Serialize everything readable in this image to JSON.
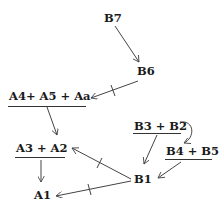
{
  "diagram": {
    "type": "directed-graph",
    "colors": {
      "text": "#1a1a1a",
      "edge": "#444444",
      "background": "#ffffff"
    },
    "nodes": [
      {
        "id": "B7",
        "label": "B7",
        "underlined": false
      },
      {
        "id": "B6",
        "label": "B6",
        "underlined": false
      },
      {
        "id": "A4A5Aa",
        "label": "A4+ A5 + Aa",
        "underlined": true
      },
      {
        "id": "A3A2",
        "label": "A3 + A2",
        "underlined": true
      },
      {
        "id": "A1",
        "label": "A1",
        "underlined": false
      },
      {
        "id": "B3B2",
        "label": "B3 + B2",
        "underlined": true
      },
      {
        "id": "B4B5",
        "label": "B4 + B5",
        "underlined": true
      },
      {
        "id": "B1",
        "label": "B1",
        "underlined": false
      }
    ],
    "edges": [
      {
        "from": "B7",
        "to": "B6",
        "marked": false
      },
      {
        "from": "B6",
        "to": "A4A5Aa",
        "marked": true
      },
      {
        "from": "A4A5Aa",
        "to": "A3A2",
        "marked": false
      },
      {
        "from": "A3A2",
        "to": "A1",
        "marked": false
      },
      {
        "from": "B3B2",
        "to": "B4B5",
        "marked": false,
        "curved": true
      },
      {
        "from": "B3B2",
        "to": "B1",
        "marked": false
      },
      {
        "from": "B4B5",
        "to": "B1",
        "marked": false
      },
      {
        "from": "B1",
        "to": "A3A2",
        "marked": true
      },
      {
        "from": "B1",
        "to": "A1",
        "marked": true
      }
    ]
  }
}
